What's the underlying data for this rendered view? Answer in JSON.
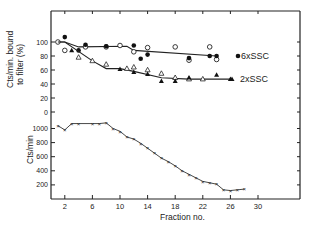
{
  "chart_data": [
    {
      "panel": "top",
      "type": "line",
      "title": "",
      "xlabel": "Fraction no.",
      "ylabel": "Cts/min. bound to filter (%)",
      "ylim": [
        0,
        120
      ],
      "yticks": [
        0,
        20,
        40,
        60,
        80,
        100
      ],
      "grid": false,
      "series": [
        {
          "name": "6xSSC",
          "marker": "line",
          "x": [
            1,
            2,
            4,
            11,
            12,
            24
          ],
          "values": [
            100,
            100,
            93,
            94,
            88,
            80
          ]
        },
        {
          "name": "6xSSC open circles",
          "marker": "open-circle",
          "x": [
            1,
            2,
            5,
            8,
            10,
            12,
            14,
            18,
            20,
            23,
            24
          ],
          "values": [
            100,
            88,
            93,
            93,
            95,
            86,
            92,
            93,
            74,
            93,
            75
          ]
        },
        {
          "name": "6xSSC filled circles",
          "marker": "filled-circle",
          "x": [
            2,
            4,
            5,
            8,
            12,
            13,
            14,
            20,
            23,
            24
          ],
          "values": [
            107,
            88,
            96,
            94,
            95,
            76,
            82,
            77,
            80,
            80
          ]
        },
        {
          "name": "2xSSC",
          "marker": "line",
          "x": [
            1,
            2,
            6,
            8,
            10,
            12,
            16,
            20,
            26
          ],
          "values": [
            100,
            100,
            73,
            62,
            62,
            58,
            49,
            47,
            47
          ]
        },
        {
          "name": "2xSSC open triangles",
          "marker": "open-triangle",
          "x": [
            4,
            6,
            8,
            11,
            12,
            14,
            16,
            18,
            20,
            22
          ],
          "values": [
            78,
            73,
            68,
            62,
            64,
            60,
            55,
            49,
            47,
            47
          ]
        },
        {
          "name": "2xSSC filled triangles",
          "marker": "filled-triangle",
          "x": [
            3,
            10,
            12,
            14,
            16,
            18,
            20,
            24,
            26
          ],
          "values": [
            88,
            61,
            57,
            54,
            44,
            44,
            49,
            53,
            47
          ]
        }
      ],
      "annotations": [
        "6xSSC",
        "2xSSC"
      ]
    },
    {
      "panel": "bottom",
      "type": "line",
      "xlabel": "Fraction no.",
      "ylabel": "Cts/min",
      "ylim": [
        0,
        1100
      ],
      "yticks": [
        200,
        400,
        600,
        800,
        1000
      ],
      "xlim": [
        0,
        36
      ],
      "xticks": [
        2,
        6,
        10,
        14,
        18,
        22,
        26,
        30
      ],
      "grid": false,
      "series": [
        {
          "name": "Cts/min",
          "marker": "x",
          "x": [
            1,
            2,
            3,
            4,
            6,
            7,
            8,
            9,
            10,
            11,
            12,
            13,
            14,
            15,
            16,
            17,
            18,
            19,
            20,
            21,
            22,
            23,
            24,
            25,
            26,
            27,
            28
          ],
          "values": [
            1040,
            980,
            1070,
            1070,
            1070,
            1070,
            1080,
            1000,
            960,
            880,
            850,
            790,
            720,
            650,
            580,
            530,
            470,
            400,
            350,
            300,
            250,
            230,
            210,
            130,
            120,
            130,
            140
          ]
        }
      ]
    }
  ],
  "labels": {
    "top_ylabel_line1": "Cts/min. bound",
    "top_ylabel_line2": "to filter (%)",
    "bottom_ylabel": "Cts/min",
    "xlabel": "Fraction no.",
    "series_6x": "6xSSC",
    "series_2x": "2xSSC",
    "top_yticks": [
      "100",
      "80",
      "60",
      "40",
      "20",
      "0"
    ],
    "bottom_yticks": [
      "1000",
      "800",
      "600",
      "400",
      "200"
    ],
    "xticks": [
      "2",
      "6",
      "10",
      "14",
      "18",
      "22",
      "26",
      "30"
    ]
  }
}
